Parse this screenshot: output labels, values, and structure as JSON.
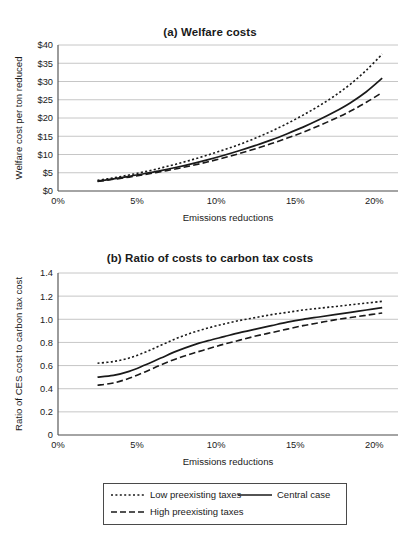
{
  "figure": {
    "panels": [
      {
        "id": "a",
        "title": "(a) Welfare costs",
        "ylabel": "Welfare cost per ton reduced",
        "xlabel": "Emissions reductions"
      },
      {
        "id": "b",
        "title": "(b) Ratio of costs to carbon tax costs",
        "ylabel": "Ratio of CES cost to carbon tax cost",
        "xlabel": "Emissions reductions"
      }
    ],
    "legend": {
      "items": [
        {
          "label": "Low preexisting taxes",
          "style": "dotted"
        },
        {
          "label": "High preexisting taxes",
          "style": "dashed"
        },
        {
          "label": "Central case",
          "style": "solid"
        }
      ]
    },
    "colors": {
      "line": "#1a1a1a",
      "grid": "#b7b7b7",
      "axis": "#4a4a4a",
      "background": "#ffffff"
    }
  },
  "chart_data": [
    {
      "type": "line",
      "panel": "a",
      "title": "(a) Welfare costs",
      "xlabel": "Emissions reductions",
      "ylabel": "Welfare cost per ton reduced",
      "xlim": [
        0,
        21.5
      ],
      "ylim": [
        0,
        40
      ],
      "xticks": [
        0,
        5,
        10,
        15,
        20
      ],
      "xticklabels": [
        "0%",
        "5%",
        "10%",
        "15%",
        "20%"
      ],
      "yticks": [
        0,
        5,
        10,
        15,
        20,
        25,
        30,
        35,
        40
      ],
      "yticklabels": [
        "$0",
        "$5",
        "$10",
        "$15",
        "$20",
        "$25",
        "$30",
        "$35",
        "$40"
      ],
      "grid": "horizontal",
      "legend_position": "below-figure",
      "x": [
        2.5,
        3.5,
        4.5,
        5.5,
        6.5,
        7.5,
        8.5,
        9.5,
        10.5,
        11.5,
        12.5,
        13.5,
        14.5,
        15.5,
        16.5,
        17.5,
        18.5,
        19.5,
        20.5
      ],
      "series": [
        {
          "name": "Low preexisting taxes",
          "style": "dotted",
          "values": [
            2.9,
            3.6,
            4.4,
            5.3,
            6.3,
            7.4,
            8.6,
            9.9,
            11.3,
            12.8,
            14.5,
            16.4,
            18.5,
            20.8,
            23.3,
            26.1,
            29.3,
            33.1,
            37.5
          ]
        },
        {
          "name": "Central case",
          "style": "solid",
          "values": [
            2.7,
            3.3,
            4.0,
            4.8,
            5.6,
            6.5,
            7.5,
            8.6,
            9.8,
            11.1,
            12.5,
            14.0,
            15.7,
            17.5,
            19.5,
            21.7,
            24.2,
            27.2,
            30.9
          ]
        },
        {
          "name": "High preexisting taxes",
          "style": "dashed",
          "values": [
            2.6,
            3.2,
            3.8,
            4.5,
            5.3,
            6.1,
            7.0,
            8.0,
            9.1,
            10.3,
            11.6,
            13.0,
            14.5,
            16.1,
            17.9,
            19.8,
            21.9,
            24.3,
            27.0
          ]
        }
      ]
    },
    {
      "type": "line",
      "panel": "b",
      "title": "(b) Ratio of costs to carbon tax costs",
      "xlabel": "Emissions reductions",
      "ylabel": "Ratio of CES cost to carbon tax cost",
      "xlim": [
        0,
        21.5
      ],
      "ylim": [
        0,
        1.4
      ],
      "xticks": [
        0,
        5,
        10,
        15,
        20
      ],
      "xticklabels": [
        "0%",
        "5%",
        "10%",
        "15%",
        "20%"
      ],
      "yticks": [
        0,
        0.2,
        0.4,
        0.6,
        0.8,
        1.0,
        1.2,
        1.4
      ],
      "yticklabels": [
        "0",
        "0.2",
        "0.4",
        "0.6",
        "0.8",
        "1.0",
        "1.2",
        "1.4"
      ],
      "grid": "horizontal",
      "legend_position": "below-figure",
      "x": [
        2.5,
        3.5,
        4.5,
        5.5,
        6.5,
        7.5,
        8.5,
        9.5,
        10.5,
        11.5,
        12.5,
        13.5,
        14.5,
        15.5,
        16.5,
        17.5,
        18.5,
        19.5,
        20.5
      ],
      "series": [
        {
          "name": "Low preexisting taxes",
          "style": "dotted",
          "values": [
            0.62,
            0.635,
            0.665,
            0.715,
            0.775,
            0.835,
            0.885,
            0.925,
            0.96,
            0.99,
            1.015,
            1.04,
            1.06,
            1.08,
            1.095,
            1.11,
            1.125,
            1.14,
            1.155
          ]
        },
        {
          "name": "Central case",
          "style": "solid",
          "values": [
            0.5,
            0.515,
            0.55,
            0.605,
            0.665,
            0.725,
            0.775,
            0.815,
            0.85,
            0.885,
            0.915,
            0.945,
            0.975,
            1.0,
            1.02,
            1.04,
            1.06,
            1.08,
            1.1
          ]
        },
        {
          "name": "High preexisting taxes",
          "style": "dashed",
          "values": [
            0.43,
            0.45,
            0.49,
            0.545,
            0.605,
            0.66,
            0.705,
            0.745,
            0.785,
            0.82,
            0.855,
            0.885,
            0.915,
            0.945,
            0.97,
            0.995,
            1.015,
            1.035,
            1.055
          ]
        }
      ]
    }
  ]
}
